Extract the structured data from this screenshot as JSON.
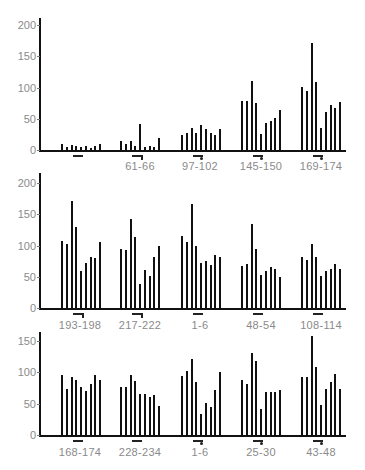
{
  "chart_data": [
    {
      "type": "bar",
      "title": "",
      "xlabel": "",
      "ylabel": "",
      "ylim": [
        0,
        200
      ],
      "yticks": [
        0,
        50,
        100,
        150,
        200
      ],
      "grid": false,
      "legend": null,
      "group_labels": [
        "",
        "61-66",
        "97-102",
        "145-150",
        "169-174"
      ],
      "group_markers": [
        "bar",
        "arrow",
        "arrow-dot",
        "arrow-dot",
        "arrow-dot"
      ],
      "series": [
        {
          "group": 1,
          "values": [
            10,
            5,
            8,
            6,
            5,
            6,
            4,
            6,
            9
          ]
        },
        {
          "group": 2,
          "values": [
            15,
            10,
            15,
            7,
            42,
            5,
            6,
            5,
            19
          ]
        },
        {
          "group": 3,
          "values": [
            24,
            27,
            35,
            28,
            40,
            33,
            27,
            24,
            33
          ]
        },
        {
          "group": 4,
          "values": [
            79,
            79,
            111,
            76,
            26,
            44,
            47,
            52,
            64
          ]
        },
        {
          "group": 5,
          "values": [
            101,
            94,
            172,
            109,
            36,
            61,
            72,
            67,
            77
          ]
        }
      ]
    },
    {
      "type": "bar",
      "title": "",
      "xlabel": "",
      "ylabel": "",
      "ylim": [
        0,
        200
      ],
      "yticks": [
        0,
        50,
        100,
        150,
        200
      ],
      "grid": false,
      "legend": null,
      "group_labels": [
        "193-198",
        "217-222",
        "1-6",
        "48-54",
        "108-114"
      ],
      "group_markers": [
        "arrow",
        "arrow",
        "bar",
        "bar",
        "bar"
      ],
      "series": [
        {
          "group": 1,
          "values": [
            108,
            103,
            171,
            130,
            60,
            72,
            81,
            80,
            105
          ]
        },
        {
          "group": 2,
          "values": [
            95,
            93,
            143,
            113,
            39,
            61,
            51,
            82,
            100
          ]
        },
        {
          "group": 3,
          "values": [
            116,
            105,
            167,
            100,
            72,
            76,
            69,
            85,
            82
          ]
        },
        {
          "group": 4,
          "values": [
            67,
            71,
            134,
            95,
            53,
            60,
            65,
            62,
            50
          ]
        },
        {
          "group": 5,
          "values": [
            82,
            77,
            103,
            82,
            51,
            60,
            63,
            71,
            62
          ]
        }
      ]
    },
    {
      "type": "bar",
      "title": "",
      "xlabel": "",
      "ylabel": "",
      "ylim": [
        0,
        160
      ],
      "yticks": [
        0,
        50,
        100,
        150
      ],
      "grid": false,
      "legend": null,
      "group_labels": [
        "168-174",
        "228-234",
        "1-6",
        "25-30",
        "43-48"
      ],
      "group_markers": [
        "bar",
        "bar",
        "arrow-dot",
        "arrow-dot",
        "arrow-dot"
      ],
      "series": [
        {
          "group": 1,
          "values": [
            95,
            73,
            92,
            88,
            77,
            70,
            82,
            95,
            87
          ]
        },
        {
          "group": 2,
          "values": [
            76,
            76,
            95,
            86,
            65,
            65,
            61,
            63,
            46
          ]
        },
        {
          "group": 3,
          "values": [
            94,
            102,
            122,
            85,
            34,
            51,
            45,
            71,
            100
          ]
        },
        {
          "group": 4,
          "values": [
            88,
            82,
            130,
            118,
            41,
            68,
            68,
            68,
            72
          ]
        },
        {
          "group": 5,
          "values": [
            93,
            93,
            158,
            109,
            48,
            74,
            85,
            98,
            74
          ]
        }
      ]
    }
  ]
}
